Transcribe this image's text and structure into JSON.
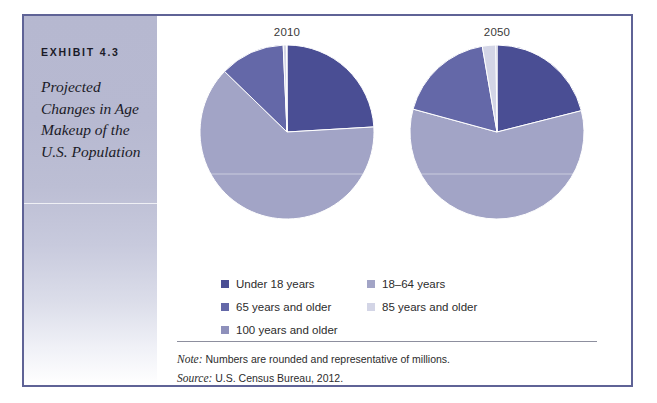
{
  "exhibit": {
    "number": "EXHIBIT 4.3",
    "title": "Projected Changes in Age Makeup of the U.S. Population"
  },
  "colors": {
    "under18": "#4a4e94",
    "age18to64": "#a2a4c6",
    "age65plus": "#6468a8",
    "age85plus": "#d3d5e6",
    "age100plus": "#8e90bb",
    "frame_border": "#5f6396",
    "caption_band_top": "#b6b8d0",
    "note_rule": "#8d8f9e"
  },
  "legend": {
    "left_column": [
      {
        "label": "Under 18 years",
        "color_key": "under18"
      },
      {
        "label": "65 years and older",
        "color_key": "age65plus"
      },
      {
        "label": "100 years and older",
        "color_key": "age100plus"
      }
    ],
    "right_column": [
      {
        "label": "18–64 years",
        "color_key": "age18to64"
      },
      {
        "label": "85 years and older",
        "color_key": "age85plus"
      }
    ]
  },
  "notes": {
    "note_lead": "Note:",
    "note_text": " Numbers are rounded and representative of millions.",
    "source_lead": "Source:",
    "source_text": " U.S. Census Bureau, 2012."
  },
  "chart_data": [
    {
      "type": "pie",
      "title": "2010",
      "categories": [
        "Under 18 years",
        "18–64 years",
        "65 years and older",
        "85 years and older",
        "100 years and older"
      ],
      "values": [
        24,
        63,
        12,
        0.6,
        0.1
      ],
      "colors": [
        "#4a4e94",
        "#a2a4c6",
        "#6468a8",
        "#d3d5e6",
        "#8e90bb"
      ],
      "start_angle": 0,
      "direction": "clockwise",
      "legend": "bottom"
    },
    {
      "type": "pie",
      "title": "2050",
      "categories": [
        "Under 18 years",
        "18–64 years",
        "65 years and older",
        "85 years and older",
        "100 years and older"
      ],
      "values": [
        21,
        58,
        18,
        2.5,
        0.2
      ],
      "colors": [
        "#4a4e94",
        "#a2a4c6",
        "#6468a8",
        "#d3d5e6",
        "#8e90bb"
      ],
      "start_angle": 0,
      "direction": "clockwise",
      "legend": "bottom"
    }
  ]
}
